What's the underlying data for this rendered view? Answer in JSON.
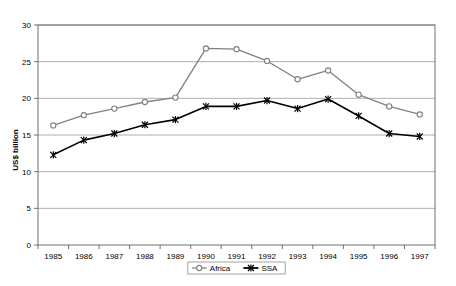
{
  "chart_data": {
    "type": "line",
    "title": "",
    "xlabel": "",
    "ylabel": "US$ billion",
    "categories": [
      "1985",
      "1986",
      "1987",
      "1988",
      "1989",
      "1990",
      "1991",
      "1992",
      "1993",
      "1994",
      "1995",
      "1996",
      "1997"
    ],
    "ylim": [
      0,
      30
    ],
    "ytick_step": 5,
    "yticks": [
      "0",
      "5",
      "10",
      "15",
      "20",
      "25",
      "30"
    ],
    "grid": "horizontal",
    "legend_position": "bottom-center",
    "series": [
      {
        "name": "Africa",
        "color": "#808080",
        "marker": "circle",
        "values": [
          16.3,
          17.7,
          18.6,
          19.5,
          20.1,
          26.8,
          26.7,
          25.1,
          22.6,
          23.8,
          20.5,
          18.9,
          17.8
        ]
      },
      {
        "name": "SSA",
        "color": "#000000",
        "marker": "cross",
        "values": [
          12.3,
          14.3,
          15.2,
          16.4,
          17.1,
          18.9,
          18.9,
          19.7,
          18.6,
          19.9,
          17.6,
          15.2,
          14.8
        ]
      }
    ]
  },
  "legend": {
    "items": [
      {
        "label": "Africa"
      },
      {
        "label": "SSA"
      }
    ]
  },
  "axes": {
    "y_title": "US$ billion"
  }
}
